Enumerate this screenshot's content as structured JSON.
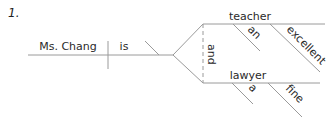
{
  "exercise_number": "1.",
  "diagram": {
    "subject": "Ms. Chang",
    "verb": "is",
    "conjunction": "and",
    "predicate_nominatives": [
      {
        "word": "teacher",
        "modifiers": [
          "an",
          "excellent"
        ]
      },
      {
        "word": "lawyer",
        "modifiers": [
          "a",
          "fine"
        ]
      }
    ]
  }
}
